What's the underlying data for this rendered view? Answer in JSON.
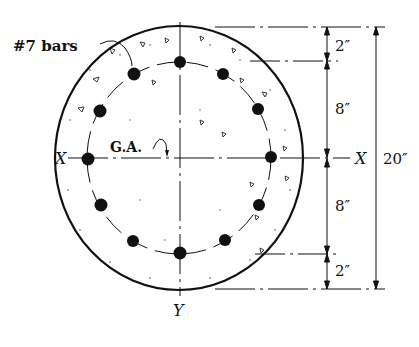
{
  "diagram": {
    "type": "circular reinforced concrete column cross-section",
    "labels": {
      "bars": "#7 bars",
      "gravity_axis": "G.A.",
      "x_axis_left": "X",
      "x_axis_right": "X",
      "y_axis": "Y"
    },
    "dimensions": {
      "top_cover": "2″",
      "upper_half": "8″",
      "lower_half": "8″",
      "bottom_cover": "2″",
      "overall": "20″"
    },
    "bar_count": 12,
    "colors": {
      "ink": "#111111",
      "background": "#ffffff"
    }
  }
}
